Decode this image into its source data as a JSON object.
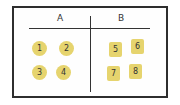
{
  "diagram": {
    "type": "t-chart",
    "columns": [
      {
        "header": "A",
        "shape": "circle",
        "items": [
          "1",
          "2",
          "3",
          "4"
        ]
      },
      {
        "header": "B",
        "shape": "square",
        "items": [
          "5",
          "6",
          "7",
          "8"
        ]
      }
    ],
    "colors": {
      "item_fill": "#e6d46e",
      "stroke": "#2e2e2e"
    }
  }
}
